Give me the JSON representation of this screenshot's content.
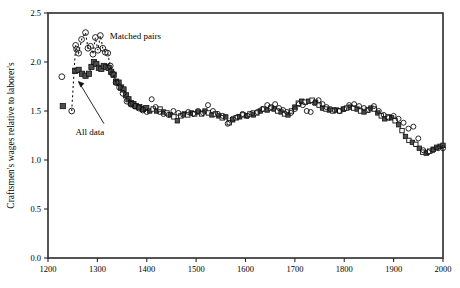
{
  "chart_data": {
    "type": "scatter",
    "title": "",
    "xlabel": "",
    "ylabel": "Craftsmen's wages relative to laborer's",
    "xlim": [
      1200,
      2000
    ],
    "ylim": [
      0.0,
      2.5
    ],
    "xticks": [
      1200,
      1300,
      1400,
      1500,
      1600,
      1700,
      1800,
      1900,
      2000
    ],
    "yticks": [
      "0.0",
      "0.5",
      "1.0",
      "1.5",
      "2.0",
      "2.5"
    ],
    "grid": false,
    "legend_position": "inline-annotations",
    "annotations": [
      {
        "text": "Matched pairs",
        "x": 1325,
        "y": 2.27
      },
      {
        "text": "All data",
        "x": 1285,
        "y": 1.3
      }
    ],
    "series": [
      {
        "name": "All data",
        "marker": "square",
        "line": true,
        "x": [
          1230,
          1255,
          1262,
          1269,
          1276,
          1283,
          1288,
          1293,
          1298,
          1303,
          1308,
          1313,
          1318,
          1323,
          1328,
          1333,
          1338,
          1343,
          1348,
          1353,
          1358,
          1363,
          1368,
          1373,
          1378,
          1385,
          1392,
          1399,
          1406,
          1413,
          1420,
          1427,
          1434,
          1441,
          1448,
          1455,
          1462,
          1469,
          1476,
          1483,
          1490,
          1497,
          1504,
          1511,
          1518,
          1525,
          1532,
          1539,
          1546,
          1553,
          1560,
          1567,
          1574,
          1581,
          1588,
          1595,
          1602,
          1609,
          1616,
          1623,
          1630,
          1637,
          1644,
          1651,
          1658,
          1665,
          1672,
          1679,
          1686,
          1693,
          1700,
          1707,
          1714,
          1721,
          1728,
          1735,
          1742,
          1749,
          1756,
          1763,
          1770,
          1777,
          1784,
          1791,
          1798,
          1805,
          1812,
          1819,
          1826,
          1833,
          1840,
          1847,
          1854,
          1861,
          1868,
          1875,
          1882,
          1889,
          1896,
          1903,
          1910,
          1917,
          1924,
          1931,
          1938,
          1945,
          1952,
          1959,
          1966,
          1973,
          1980,
          1987,
          1994,
          2000
        ],
        "y": [
          1.55,
          1.91,
          1.92,
          1.88,
          1.86,
          1.88,
          1.95,
          2.0,
          1.98,
          1.94,
          1.93,
          1.96,
          1.95,
          1.94,
          1.9,
          1.87,
          1.8,
          1.79,
          1.74,
          1.72,
          1.66,
          1.62,
          1.58,
          1.57,
          1.55,
          1.54,
          1.52,
          1.53,
          1.5,
          1.52,
          1.5,
          1.52,
          1.49,
          1.48,
          1.46,
          1.44,
          1.4,
          1.45,
          1.47,
          1.46,
          1.48,
          1.47,
          1.49,
          1.47,
          1.5,
          1.48,
          1.46,
          1.47,
          1.45,
          1.43,
          1.44,
          1.38,
          1.41,
          1.43,
          1.44,
          1.46,
          1.45,
          1.47,
          1.46,
          1.48,
          1.5,
          1.52,
          1.51,
          1.53,
          1.52,
          1.5,
          1.49,
          1.47,
          1.46,
          1.5,
          1.54,
          1.58,
          1.6,
          1.59,
          1.6,
          1.61,
          1.59,
          1.56,
          1.53,
          1.52,
          1.51,
          1.5,
          1.51,
          1.5,
          1.52,
          1.53,
          1.54,
          1.53,
          1.52,
          1.5,
          1.49,
          1.51,
          1.53,
          1.52,
          1.48,
          1.45,
          1.42,
          1.44,
          1.43,
          1.4,
          1.36,
          1.3,
          1.24,
          1.2,
          1.18,
          1.16,
          1.12,
          1.08,
          1.07,
          1.09,
          1.11,
          1.13,
          1.14,
          1.15
        ]
      },
      {
        "name": "Matched pairs",
        "marker": "circle",
        "line": false,
        "x": [
          1228,
          1248,
          1256,
          1258,
          1262,
          1268,
          1276,
          1281,
          1286,
          1291,
          1296,
          1301,
          1306,
          1311,
          1316,
          1321,
          1326,
          1331,
          1338,
          1345,
          1352,
          1360,
          1368,
          1376,
          1384,
          1392,
          1400,
          1410,
          1418,
          1426,
          1434,
          1444,
          1454,
          1464,
          1474,
          1484,
          1494,
          1504,
          1514,
          1524,
          1534,
          1544,
          1554,
          1564,
          1574,
          1584,
          1594,
          1604,
          1614,
          1624,
          1634,
          1644,
          1652,
          1660,
          1668,
          1676,
          1684,
          1692,
          1700,
          1708,
          1716,
          1724,
          1732,
          1740,
          1748,
          1756,
          1764,
          1772,
          1780,
          1790,
          1800,
          1810,
          1820,
          1830,
          1840,
          1850,
          1860,
          1870,
          1880,
          1890,
          1900,
          1910,
          1920,
          1930,
          1940,
          1950,
          1960,
          1970,
          1980,
          1990,
          2000
        ],
        "y": [
          1.85,
          1.5,
          2.17,
          2.13,
          2.09,
          2.23,
          2.3,
          2.14,
          2.16,
          2.08,
          2.25,
          2.12,
          2.27,
          2.14,
          2.1,
          2.09,
          1.96,
          1.88,
          1.79,
          1.74,
          1.68,
          1.6,
          1.57,
          1.55,
          1.53,
          1.51,
          1.49,
          1.62,
          1.54,
          1.49,
          1.47,
          1.46,
          1.5,
          1.48,
          1.46,
          1.49,
          1.47,
          1.5,
          1.48,
          1.56,
          1.5,
          1.47,
          1.45,
          1.37,
          1.42,
          1.44,
          1.47,
          1.45,
          1.48,
          1.49,
          1.52,
          1.56,
          1.54,
          1.57,
          1.53,
          1.51,
          1.49,
          1.48,
          1.52,
          1.57,
          1.56,
          1.5,
          1.49,
          1.58,
          1.61,
          1.57,
          1.54,
          1.52,
          1.51,
          1.5,
          1.52,
          1.56,
          1.57,
          1.55,
          1.53,
          1.51,
          1.55,
          1.5,
          1.46,
          1.43,
          1.45,
          1.42,
          1.38,
          1.32,
          1.34,
          1.22,
          1.1,
          1.08,
          1.1,
          1.12,
          1.12
        ]
      }
    ]
  }
}
